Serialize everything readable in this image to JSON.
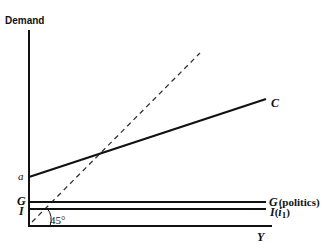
{
  "diagram": {
    "y_axis_label": "Demand",
    "x_axis_label": "Y",
    "intercept_label": "a",
    "left_labels": {
      "G": "G",
      "I": "I"
    },
    "angle_label": "45°",
    "lines": {
      "consumption": {
        "label": "C"
      },
      "government": {
        "label": "G",
        "suffix": "(politics)"
      },
      "investment": {
        "label": "I",
        "suffix_open": "(",
        "suffix_i": "i",
        "suffix_sub": "1",
        "suffix_close": ")"
      }
    },
    "colors": {
      "ink": "#111111",
      "background": "#ffffff",
      "dashed": "#333333"
    }
  }
}
